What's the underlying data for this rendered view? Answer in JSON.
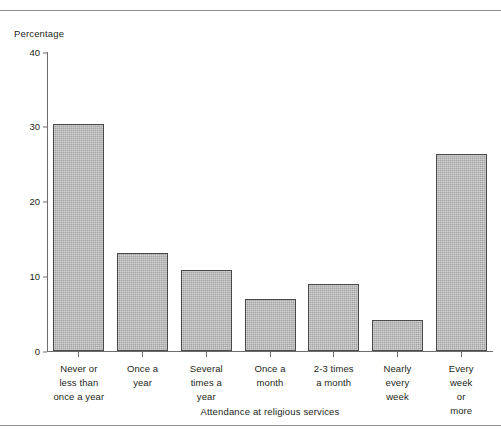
{
  "figure": {
    "clipped_header_text": "",
    "y_axis_title": "Percentage",
    "x_axis_title": "Attendance at religious services"
  },
  "colors": {
    "bar_fill": "#b6b6b6",
    "bar_border": "#4a4a4a",
    "axis": "#6d6d6d",
    "rule": "#8c8c8c",
    "text": "#231f20",
    "background": "#ffffff"
  },
  "chart_data": {
    "type": "bar",
    "title": "",
    "xlabel": "Attendance at religious services",
    "ylabel": "Percentage",
    "ylim": [
      0,
      40
    ],
    "yticks": [
      0,
      10,
      20,
      30,
      40
    ],
    "ytick_labels": [
      "0",
      "10",
      "20",
      "30",
      "40"
    ],
    "grid": false,
    "legend": null,
    "categories": [
      "Never or\nless than\nonce a year",
      "Once a\nyear",
      "Several\ntimes a\nyear",
      "Once a\nmonth",
      "2-3 times\na month",
      "Nearly\nevery\nweek",
      "Every\nweek\nor\nmore"
    ],
    "values": [
      30.4,
      13.1,
      10.9,
      6.9,
      9.0,
      4.1,
      26.4
    ]
  }
}
